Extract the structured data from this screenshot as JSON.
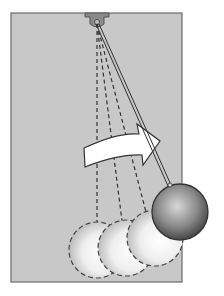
{
  "figure": {
    "background_color": "#c8c8c8",
    "pivot": {
      "x": 97,
      "y": 22
    },
    "ghost_positions": [
      {
        "cx": 97,
        "cy": 250
      },
      {
        "cx": 126,
        "cy": 248
      },
      {
        "cx": 155,
        "cy": 238
      }
    ],
    "current_position": {
      "cx": 180,
      "cy": 212
    },
    "arrow": "motion-direction-right"
  }
}
